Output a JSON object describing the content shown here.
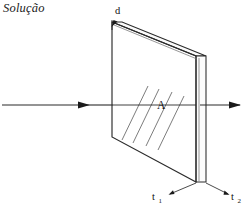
{
  "figure": {
    "caption_title": "Solução",
    "colors": {
      "ink": "#1a1a1a",
      "line": "#2b2b2b",
      "hatch": "#555555",
      "background": "#ffffff"
    },
    "labels": {
      "thickness": "d",
      "area": "A",
      "time_in": "t",
      "time_in_sub": "1",
      "time_out": "t",
      "time_out_sub": "2"
    },
    "icons": {
      "incoming_ray": "arrow-right-icon",
      "outgoing_ray": "arrow-right-icon",
      "thickness_pointer": "arrow-down-left-icon",
      "t1_pointer": "leader-line-icon",
      "t2_pointer": "leader-line-icon"
    },
    "geometry": {
      "slab_front_face": "112,22 196,56 196,182 112,137",
      "slab_top_face": "112,22 122,22 206,56 196,56",
      "slab_right_face": "196,56 206,56 206,182 196,182",
      "hatch_lines": [
        "122,140 148,86",
        "133,143 159,89",
        "146,146 172,92",
        "158,150 184,96"
      ],
      "ray_in": "2,105 88,105",
      "ray_in_inside": "88,105 196,105",
      "ray_out": "206,105 238,105"
    }
  }
}
